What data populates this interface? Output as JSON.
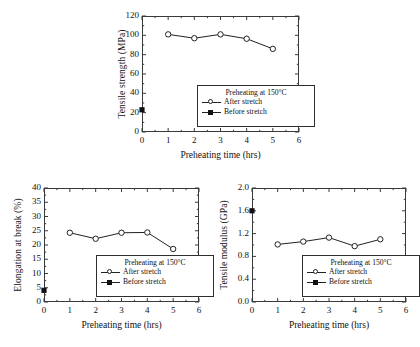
{
  "figure": {
    "background": "#ffffff",
    "line_color": "#222222",
    "marker_open_fill": "#ffffff",
    "marker_filled_fill": "#111111"
  },
  "legend": {
    "title": "Preheating at 150°C",
    "after_label": "After stretch",
    "before_label": "Before stretch"
  },
  "chart_data": [
    {
      "type": "line",
      "title": "",
      "xlabel": "Preheating time (hrs)",
      "ylabel": "Tensile strength (MPa)",
      "xlim": [
        0,
        6
      ],
      "ylim": [
        0,
        120
      ],
      "xticks": [
        0,
        1,
        2,
        3,
        4,
        5,
        6
      ],
      "yticks": [
        0,
        20,
        40,
        60,
        80,
        100,
        120
      ],
      "xticklabels": [
        "0",
        "1",
        "2",
        "3",
        "4",
        "5",
        "6"
      ],
      "yticklabels": [
        "0",
        "20",
        "40",
        "60",
        "80",
        "100",
        "120"
      ],
      "grid": false,
      "legend_position": "lower right",
      "series": [
        {
          "name": "After stretch",
          "marker": "open-circle",
          "x": [
            1,
            2,
            3,
            4,
            5
          ],
          "values": [
            101,
            97,
            101,
            96.5,
            86
          ]
        },
        {
          "name": "Before stretch",
          "marker": "filled-square",
          "x": [
            0
          ],
          "values": [
            23
          ]
        }
      ]
    },
    {
      "type": "line",
      "title": "",
      "xlabel": "Preheating time (hrs)",
      "ylabel": "Elongation at break (%)",
      "xlim": [
        0,
        6
      ],
      "ylim": [
        0,
        40
      ],
      "xticks": [
        0,
        1,
        2,
        3,
        4,
        5,
        6
      ],
      "yticks": [
        0,
        5,
        10,
        15,
        20,
        25,
        30,
        35,
        40
      ],
      "xticklabels": [
        "0",
        "1",
        "2",
        "3",
        "4",
        "5",
        "6"
      ],
      "yticklabels": [
        "0",
        "5",
        "10",
        "15",
        "20",
        "25",
        "30",
        "35",
        "40"
      ],
      "grid": false,
      "legend_position": "lower right",
      "series": [
        {
          "name": "After stretch",
          "marker": "open-circle",
          "x": [
            1,
            2,
            3,
            4,
            5
          ],
          "values": [
            24.3,
            22.2,
            24.3,
            24.4,
            18.6
          ]
        },
        {
          "name": "Before stretch",
          "marker": "filled-square",
          "x": [
            0
          ],
          "values": [
            4.1
          ]
        }
      ]
    },
    {
      "type": "line",
      "title": "",
      "xlabel": "Preheating time (hrs)",
      "ylabel": "Tensile modulus (GPa)",
      "xlim": [
        0,
        6
      ],
      "ylim": [
        0.0,
        2.0
      ],
      "xticks": [
        0,
        1,
        2,
        3,
        4,
        5,
        6
      ],
      "yticks": [
        0.0,
        0.4,
        0.8,
        1.2,
        1.6,
        2.0
      ],
      "xticklabels": [
        "0",
        "1",
        "2",
        "3",
        "4",
        "5",
        "6"
      ],
      "yticklabels": [
        "0.0",
        "0.4",
        "0.8",
        "1.2",
        "1.6",
        "2.0"
      ],
      "grid": false,
      "legend_position": "lower right",
      "series": [
        {
          "name": "After stretch",
          "marker": "open-circle",
          "x": [
            1,
            2,
            3,
            4,
            5
          ],
          "values": [
            1.01,
            1.06,
            1.13,
            0.98,
            1.1
          ]
        },
        {
          "name": "Before stretch",
          "marker": "filled-square",
          "x": [
            0
          ],
          "values": [
            1.6
          ]
        }
      ]
    }
  ]
}
